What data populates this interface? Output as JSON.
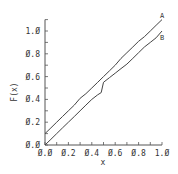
{
  "chart_data": {
    "type": "line",
    "title": "",
    "xlabel": "x",
    "ylabel": "F(x)",
    "xlim": [
      0.0,
      1.0
    ],
    "ylim": [
      0.0,
      1.1
    ],
    "grid": false,
    "legend_position": "inline-end-labels",
    "x_ticks": [
      "0.0",
      "0.2",
      "0.4",
      "0.6",
      "0.8",
      "1.0"
    ],
    "y_ticks": [
      "0.0",
      "0.2",
      "0.4",
      "0.6",
      "0.8",
      "1.0"
    ],
    "series": [
      {
        "name": "A",
        "x": [
          0.0,
          0.05,
          0.1,
          0.15,
          0.2,
          0.25,
          0.3,
          0.35,
          0.4,
          0.45,
          0.5,
          0.55,
          0.6,
          0.65,
          0.7,
          0.75,
          0.8,
          0.85,
          0.9,
          0.95,
          1.0
        ],
        "values": [
          0.1,
          0.15,
          0.2,
          0.25,
          0.3,
          0.35,
          0.41,
          0.45,
          0.5,
          0.55,
          0.6,
          0.65,
          0.7,
          0.76,
          0.81,
          0.86,
          0.91,
          0.95,
          1.0,
          1.05,
          1.1
        ]
      },
      {
        "name": "B",
        "x": [
          0.0,
          0.05,
          0.1,
          0.15,
          0.2,
          0.25,
          0.3,
          0.35,
          0.4,
          0.45,
          0.48,
          0.5,
          0.55,
          0.6,
          0.65,
          0.7,
          0.75,
          0.8,
          0.85,
          0.9,
          0.95,
          1.0
        ],
        "values": [
          0.0,
          0.05,
          0.1,
          0.15,
          0.2,
          0.25,
          0.3,
          0.35,
          0.4,
          0.44,
          0.46,
          0.55,
          0.59,
          0.63,
          0.67,
          0.71,
          0.76,
          0.81,
          0.86,
          0.9,
          0.94,
          1.0
        ]
      }
    ]
  },
  "axes": {
    "x_label": "x",
    "y_label": "F(x)"
  }
}
